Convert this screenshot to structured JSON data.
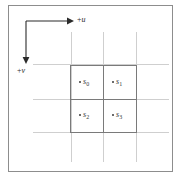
{
  "figure": {
    "background_color": "#ffffff",
    "frame_color": "#8d8d8d",
    "gridline_color": "#cfcfcf",
    "pixel_block_color": "#7a7a7a",
    "sample_dot_color": "#3a3a3a",
    "axis_color": "#2b2b2b"
  },
  "axes": {
    "horizontal": {
      "label_sign": "+",
      "label_var": "u",
      "label_text": "+u",
      "direction": "right",
      "arrowhead": "arrow-right-icon"
    },
    "vertical": {
      "label_sign": "+",
      "label_var": "v",
      "label_text": "+v",
      "direction": "down",
      "arrowhead": "arrow-down-icon"
    }
  },
  "samples": [
    {
      "id": "s0",
      "sign": "s",
      "index": "0",
      "cell": "top-left"
    },
    {
      "id": "s1",
      "sign": "s",
      "index": "1",
      "cell": "top-right"
    },
    {
      "id": "s2",
      "sign": "s",
      "index": "2",
      "cell": "bottom-left"
    },
    {
      "id": "s3",
      "sign": "s",
      "index": "3",
      "cell": "bottom-right"
    }
  ],
  "grid": {
    "vertical_lines": [
      71,
      103,
      136
    ],
    "horizontal_lines": [
      68,
      103,
      136
    ],
    "block": {
      "left": 70,
      "top": 69,
      "width": 67,
      "height": 68
    }
  }
}
